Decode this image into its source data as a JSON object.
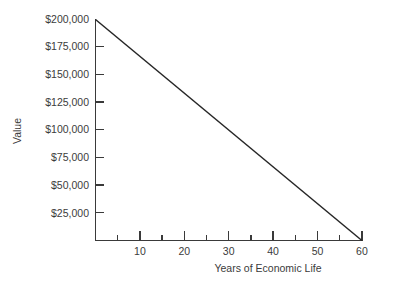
{
  "chart_data": {
    "type": "line",
    "title": "",
    "xlabel": "Years of Economic Life",
    "ylabel": "Value",
    "x": [
      0,
      60
    ],
    "values": [
      200000,
      0
    ],
    "series": [
      {
        "name": "Straight-line depreciation",
        "x": [
          0,
          60
        ],
        "values": [
          200000,
          0
        ]
      }
    ],
    "xlim": [
      0,
      60
    ],
    "ylim": [
      0,
      200000
    ],
    "grid": false,
    "legend": false,
    "x_major_ticks": [
      10,
      20,
      30,
      40,
      50,
      60
    ],
    "x_major_tick_labels": [
      "10",
      "20",
      "30",
      "40",
      "50",
      "60"
    ],
    "x_minor_ticks": [
      5,
      15,
      25,
      35,
      45,
      55
    ],
    "y_ticks": [
      25000,
      50000,
      75000,
      100000,
      125000,
      150000,
      175000,
      200000
    ],
    "y_tick_labels": [
      "$25,000",
      "$50,000",
      "$75,000",
      "$100,000",
      "$125,000",
      "$150,000",
      "$175,000",
      "$200,000"
    ],
    "line_color": "#262626",
    "axis_color": "#3a3a3a",
    "text_color": "#3b3b3b",
    "background_color": "#ffffff"
  }
}
